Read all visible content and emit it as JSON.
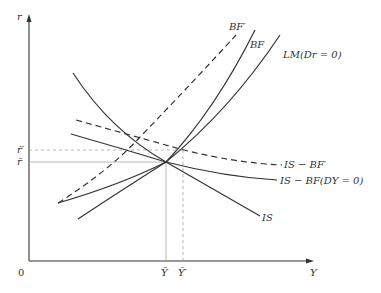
{
  "diagram": {
    "type": "IS-LM-BF economics diagram",
    "axes": {
      "y_label": "r",
      "x_label": "Y",
      "origin_label": "0"
    },
    "ticks": {
      "r_bar": "r̄",
      "r_bar_prime": "r̄′",
      "y_bar": "Ȳ",
      "y_bar_prime": "Ȳ′"
    },
    "curves": {
      "bf_prime": "BF′",
      "bf": "BF",
      "lm": "LM(Dr = 0)",
      "is_bf_prime": "IS − BF′",
      "is_bf": "IS − BF(DY = 0)",
      "is": "IS"
    },
    "colors": {
      "line": "#333333",
      "guide": "#999999",
      "background": "#ffffff"
    }
  }
}
